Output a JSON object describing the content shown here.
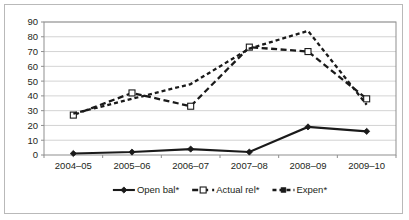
{
  "chart_data": {
    "type": "line",
    "title": "",
    "subtitle": "",
    "xlabel": "",
    "ylabel": "",
    "categories": [
      "2004–05",
      "2005–06",
      "2006–07",
      "2007–08",
      "2008–09",
      "2009–10"
    ],
    "ylim": [
      0,
      90
    ],
    "yticks": [
      0,
      10,
      20,
      30,
      40,
      50,
      60,
      70,
      80,
      90
    ],
    "ytick_labels": [
      "0",
      "10",
      "20",
      "30",
      "40",
      "50",
      "60",
      "70",
      "80",
      "90"
    ],
    "grid": true,
    "legend_position": "bottom",
    "series": [
      {
        "name": "Open bal*",
        "values": [
          1,
          2,
          4,
          2,
          19,
          16
        ],
        "style": "solid",
        "marker": "diamond",
        "color": "#1a1a1a"
      },
      {
        "name": "Actual rel*",
        "values": [
          27,
          42,
          33,
          73,
          70,
          38
        ],
        "style": "dashed",
        "marker": "square",
        "color": "#1a1a1a"
      },
      {
        "name": "Expen*",
        "values": [
          28,
          38,
          48,
          72,
          84,
          34
        ],
        "style": "dotted",
        "marker": "none",
        "color": "#1a1a1a"
      }
    ],
    "legend": [
      "Open bal*",
      "Actual rel*",
      "Expen*"
    ]
  },
  "colors": {
    "background": "#ffffff",
    "frame": "#b9b9b9",
    "axis": "#8f8f8f",
    "grid": "#c8c8c8",
    "ink": "#231f20"
  }
}
